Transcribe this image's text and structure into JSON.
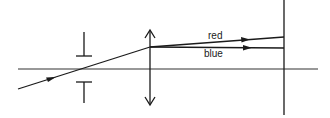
{
  "diagram": {
    "type": "optics-ray-diagram",
    "elements": {
      "optical_axis": "optical-axis",
      "aperture_stop": "aperture-stop",
      "lens": "converging-lens",
      "screen": "screen"
    },
    "labels": {
      "red": "red",
      "blue": "blue"
    },
    "colors": {
      "stroke": "#1a1a1a",
      "background": "#ffffff"
    }
  }
}
